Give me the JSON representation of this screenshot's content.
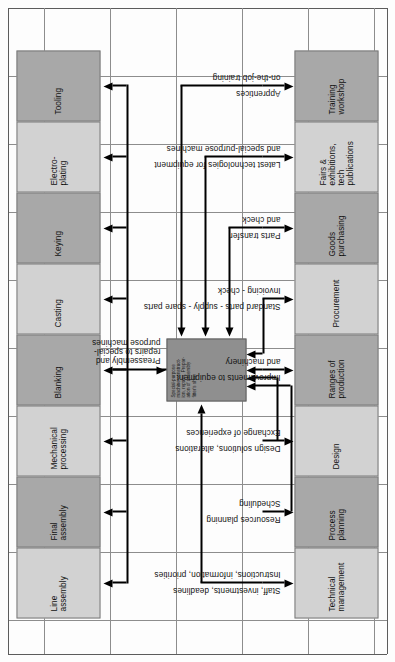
{
  "diagram": {
    "orientation": "rotated-90",
    "background": "graph-paper",
    "colors": {
      "grid_line": "#8d8d8d",
      "cell_light": "#d2d2d2",
      "cell_dark": "#a8a8a8",
      "center_box": "#8f8f8f",
      "arrow": "#000000",
      "text": "#111111"
    }
  },
  "center_node": {
    "label": "Special-purpose\nmachine construct-\nion, repairs, Prepar-\nation of assembly\nfitter's shop"
  },
  "top_flow": {
    "label": "Preassembly and\nrepairs to special-\npurpose machines"
  },
  "outputs": [
    {
      "label": "Line\nassembly",
      "shade": "light"
    },
    {
      "label": "Final\nassembly",
      "shade": "dark"
    },
    {
      "label": "Mechanical\nprocessing",
      "shade": "light"
    },
    {
      "label": "Blanking",
      "shade": "dark"
    },
    {
      "label": "Casting",
      "shade": "light"
    },
    {
      "label": "Keying",
      "shade": "dark"
    },
    {
      "label": "Electro-\nplating",
      "shade": "light"
    },
    {
      "label": "Tooling",
      "shade": "dark"
    }
  ],
  "inputs": [
    {
      "label": "Technical\nmanagement",
      "shade": "light",
      "flows": [
        "Staff, investments, deadlines",
        "Instructions, information, priorities"
      ]
    },
    {
      "label": "Process\nplanning",
      "shade": "dark",
      "flows": [
        "Resources planning",
        "Scheduling"
      ]
    },
    {
      "label": "Design",
      "shade": "light",
      "flows": [
        "Design solutions, alterations",
        "Exchange of experiences"
      ]
    },
    {
      "label": "Ranges of\nproduction",
      "shade": "dark",
      "flows": [
        "Improvements to equipment",
        "and machinery"
      ]
    },
    {
      "label": "Procurement",
      "shade": "light",
      "flows": [
        "Standard parts - supply - spare parts",
        "Invoicing - check"
      ]
    },
    {
      "label": "Goods\npurchasing",
      "shade": "dark",
      "flows": [
        "Parts transfer",
        "and check"
      ]
    },
    {
      "label": "Fairs &\nexhibitions,\ntech\npublications",
      "shade": "light",
      "flows": [
        "Latest technologies for equipment",
        "and special-purpose machines"
      ]
    },
    {
      "label": "Training\nworkshop",
      "shade": "dark",
      "flows": [
        "Apprentices",
        "on-the-job training"
      ]
    }
  ]
}
